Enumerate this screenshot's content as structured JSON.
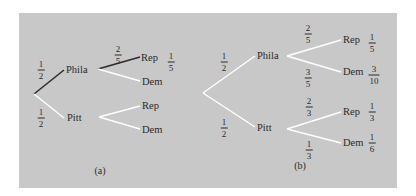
{
  "colors": {
    "background": "#ffffff",
    "panel": "#c8c8c8",
    "highlight_edge": "#2e2e2e",
    "normal_edge": "#ffffff",
    "text": "#2b2b2b"
  },
  "trees": [
    {
      "id": "a",
      "caption": "(a)",
      "nodes": {
        "root": {
          "label": "",
          "x": 34,
          "y": 94
        },
        "phila": {
          "label": "Phila",
          "x": 66,
          "y": 70
        },
        "pitt": {
          "label": "Pitt",
          "x": 67,
          "y": 118
        },
        "phila_rep": {
          "label": "Rep",
          "x": 140,
          "y": 57
        },
        "phila_dem": {
          "label": "Dem",
          "x": 141,
          "y": 81
        },
        "pitt_rep": {
          "label": "Rep",
          "x": 141,
          "y": 106
        },
        "pitt_dem": {
          "label": "Dem",
          "x": 141,
          "y": 129
        }
      },
      "edges": [
        {
          "from": "root",
          "to": "phila",
          "prob": {
            "num": "1",
            "den": "2"
          },
          "highlight": true
        },
        {
          "from": "root",
          "to": "pitt",
          "prob": {
            "num": "1",
            "den": "2"
          },
          "highlight": false
        },
        {
          "from": "phila",
          "to": "phila_rep",
          "prob": {
            "num": "2",
            "den": "5"
          },
          "highlight": true
        },
        {
          "from": "phila",
          "to": "phila_dem",
          "prob": null,
          "highlight": false
        },
        {
          "from": "pitt",
          "to": "pitt_rep",
          "prob": null,
          "highlight": false
        },
        {
          "from": "pitt",
          "to": "pitt_dem",
          "prob": null,
          "highlight": false
        }
      ],
      "outcomes": [
        {
          "node": "phila_rep",
          "prob": {
            "num": "1",
            "den": "5"
          }
        }
      ],
      "labels": {
        "root_phila_prob": {
          "num": "1",
          "den": "2"
        },
        "root_pitt_prob": {
          "num": "1",
          "den": "2"
        },
        "phila_rep_prob": {
          "num": "2",
          "den": "5"
        },
        "phila_rep_outcome": {
          "num": "1",
          "den": "5"
        }
      }
    },
    {
      "id": "b",
      "caption": "(b)",
      "nodes": {
        "root": {
          "label": "",
          "x": 203,
          "y": 93
        },
        "phila": {
          "label": "Phila",
          "x": 257,
          "y": 56
        },
        "pitt": {
          "label": "Pitt",
          "x": 257,
          "y": 128
        },
        "phila_rep": {
          "label": "Rep",
          "x": 343,
          "y": 40
        },
        "phila_dem": {
          "label": "Dem",
          "x": 343,
          "y": 72
        },
        "pitt_rep": {
          "label": "Rep",
          "x": 343,
          "y": 112
        },
        "pitt_dem": {
          "label": "Dem",
          "x": 343,
          "y": 143
        }
      },
      "edges": [
        {
          "from": "root",
          "to": "phila",
          "prob": {
            "num": "1",
            "den": "2"
          },
          "highlight": false
        },
        {
          "from": "root",
          "to": "pitt",
          "prob": {
            "num": "1",
            "den": "2"
          },
          "highlight": false
        },
        {
          "from": "phila",
          "to": "phila_rep",
          "prob": {
            "num": "2",
            "den": "5"
          },
          "highlight": false
        },
        {
          "from": "phila",
          "to": "phila_dem",
          "prob": {
            "num": "3",
            "den": "5"
          },
          "highlight": false
        },
        {
          "from": "pitt",
          "to": "pitt_rep",
          "prob": {
            "num": "2",
            "den": "3"
          },
          "highlight": false
        },
        {
          "from": "pitt",
          "to": "pitt_dem",
          "prob": {
            "num": "1",
            "den": "3"
          },
          "highlight": false
        }
      ],
      "outcomes": [
        {
          "node": "phila_rep",
          "prob": {
            "num": "1",
            "den": "5"
          }
        },
        {
          "node": "phila_dem",
          "prob": {
            "num": "3",
            "den": "10"
          }
        },
        {
          "node": "pitt_rep",
          "prob": {
            "num": "1",
            "den": "3"
          }
        },
        {
          "node": "pitt_dem",
          "prob": {
            "num": "1",
            "den": "6"
          }
        }
      ]
    }
  ],
  "a": {
    "caption": "(a)",
    "phila": "Phila",
    "pitt": "Pitt",
    "rep1": "Rep",
    "dem1": "Dem",
    "rep2": "Rep",
    "dem2": "Dem",
    "p_phila": {
      "num": "1",
      "den": "2"
    },
    "p_pitt": {
      "num": "1",
      "den": "2"
    },
    "p_phila_rep": {
      "num": "2",
      "den": "5"
    },
    "o_phila_rep": {
      "num": "1",
      "den": "5"
    }
  },
  "b": {
    "caption": "(b)",
    "phila": "Phila",
    "pitt": "Pitt",
    "rep1": "Rep",
    "dem1": "Dem",
    "rep2": "Rep",
    "dem2": "Dem",
    "p_phila": {
      "num": "1",
      "den": "2"
    },
    "p_pitt": {
      "num": "1",
      "den": "2"
    },
    "p_phila_rep": {
      "num": "2",
      "den": "5"
    },
    "p_phila_dem": {
      "num": "3",
      "den": "5"
    },
    "p_pitt_rep": {
      "num": "2",
      "den": "3"
    },
    "p_pitt_dem": {
      "num": "1",
      "den": "3"
    },
    "o_phila_rep": {
      "num": "1",
      "den": "5"
    },
    "o_phila_dem": {
      "num": "3",
      "den": "10"
    },
    "o_pitt_rep": {
      "num": "1",
      "den": "3"
    },
    "o_pitt_dem": {
      "num": "1",
      "den": "6"
    }
  }
}
